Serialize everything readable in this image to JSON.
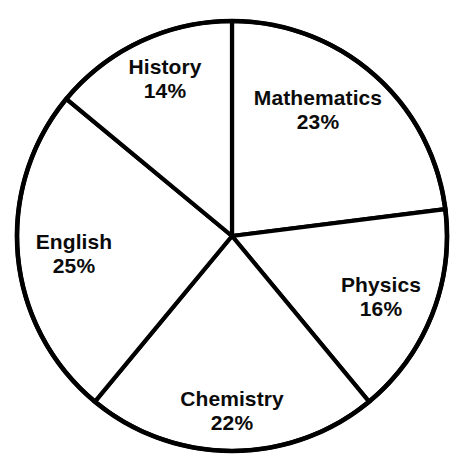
{
  "chart_data": {
    "type": "pie",
    "title": "",
    "subtitle": "",
    "xlabel": "",
    "ylabel": "",
    "legend_position": "none",
    "grid": false,
    "units": "percent",
    "start_angle_deg": 90,
    "direction": "clockwise",
    "categories": [
      "Mathematics",
      "Physics",
      "Chemistry",
      "English",
      "History"
    ],
    "values": [
      23,
      16,
      22,
      25,
      14
    ],
    "slices": [
      {
        "label": "Mathematics",
        "value": 23,
        "value_text": "23%",
        "start_deg": 0.0,
        "sweep_deg": 82.8,
        "label_x": 318,
        "label_y": 110
      },
      {
        "label": "Physics",
        "value": 16,
        "value_text": "16%",
        "start_deg": 82.8,
        "sweep_deg": 57.6,
        "label_x": 381,
        "label_y": 297
      },
      {
        "label": "Chemistry",
        "value": 22,
        "value_text": "22%",
        "start_deg": 140.4,
        "sweep_deg": 79.2,
        "label_x": 232,
        "label_y": 411
      },
      {
        "label": "English",
        "value": 25,
        "value_text": "25%",
        "start_deg": 219.6,
        "sweep_deg": 90.0,
        "label_x": 74,
        "label_y": 254
      },
      {
        "label": "History",
        "value": 14,
        "value_text": "14%",
        "start_deg": 309.6,
        "sweep_deg": 50.4,
        "label_x": 165,
        "label_y": 79
      }
    ],
    "geometry": {
      "center_x": 232,
      "center_y": 236,
      "radius": 215
    },
    "colors": {
      "slice_fill": "#ffffff",
      "stroke": "#000000",
      "label_text": "#0b0b0b",
      "background": "#ffffff"
    }
  }
}
